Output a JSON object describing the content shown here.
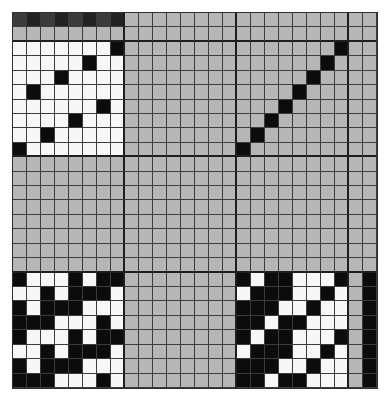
{
  "draft": {
    "title": "Weaving draft grid",
    "rows": 26,
    "cols": 26,
    "section_breaks_cols": [
      7,
      15,
      23
    ],
    "section_breaks_rows": [
      1,
      9,
      17
    ],
    "colors": {
      "g": "#b6b6b6",
      "w": "#f7f7f7",
      "b": "#0c0c0c",
      "d1": "#3b3b3b",
      "d2": "#222222",
      "grid_line": "#3c3c3c"
    },
    "warp_color_row": [
      "d1",
      "d2",
      "d1",
      "d2",
      "d1",
      "d2",
      "d1",
      "d2",
      "g",
      "g",
      "g",
      "g",
      "g",
      "g",
      "g",
      "g",
      "g",
      "g",
      "g",
      "g",
      "g",
      "g",
      "g",
      "g",
      "g",
      "g"
    ],
    "threading": {
      "comment": "top-left 8x8 block, rows top to bottom, value = column index of black cell",
      "black_col_per_row": [
        7,
        5,
        3,
        1,
        6,
        4,
        2,
        0
      ]
    },
    "tieup": {
      "comment": "top-right 8x8 block (cols 16-23), value = column offset of black cell",
      "black_col_per_row": [
        7,
        6,
        5,
        4,
        3,
        2,
        1,
        0
      ]
    },
    "drawdown_left": [
      "BWWWBWBB",
      "WWBWBBBW",
      "BWBBBWWW",
      "BBBWWWBW",
      "BWWWBWBB",
      "WWBWBBBW",
      "BWBBBWWW",
      "BBBWWWBW"
    ],
    "drawdown_right": [
      "BWBBWWWB",
      "WBBBWWBW",
      "BBBWWBWW",
      "BBWBBWWW",
      "BWBBWWWB",
      "WBBBWWBW",
      "BBBWWBWW",
      "BBWBBWWW"
    ],
    "weft_color_col": {
      "col24": "g",
      "col25": "b"
    }
  }
}
